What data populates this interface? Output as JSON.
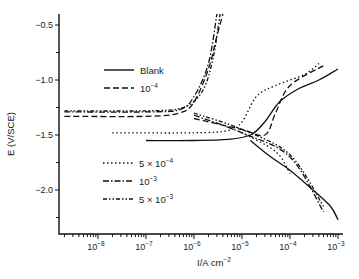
{
  "chart_data": {
    "type": "line",
    "title": "",
    "xlabel": "I/A cm⁻²",
    "ylabel": "E (V/SCE)",
    "xscale": "log",
    "xlim": [
      2e-09,
      0.0013
    ],
    "ylim": [
      -2.35,
      -0.4
    ],
    "grid": false,
    "legend_position": "inside-left",
    "x_ticks": [
      {
        "base": "10",
        "exp": "−8",
        "value": 1e-08
      },
      {
        "base": "10",
        "exp": "−7",
        "value": 1e-07
      },
      {
        "base": "10",
        "exp": "−6",
        "value": 1e-06
      },
      {
        "base": "10",
        "exp": "−5",
        "value": 1e-05
      },
      {
        "base": "10",
        "exp": "−4",
        "value": 0.0001
      },
      {
        "base": "10",
        "exp": "−3",
        "value": 0.001
      }
    ],
    "y_ticks": [
      {
        "label": "−0.5",
        "value": -0.5
      },
      {
        "label": "−1.0",
        "value": -1.0
      },
      {
        "label": "−1.5",
        "value": -1.5
      },
      {
        "label": "−2.0",
        "value": -2.0
      }
    ],
    "series": [
      {
        "name": "Blank",
        "legend_base": "Blank",
        "legend_exp": "",
        "legend_mult": "",
        "style": "solid",
        "corrosion_potential": -1.55,
        "corrosion_current": 1.5e-05,
        "anodic": [
          [
            1e-07,
            -1.55
          ],
          [
            1e-06,
            -1.55
          ],
          [
            5e-06,
            -1.54
          ],
          [
            1.5e-05,
            -1.5
          ],
          [
            3e-05,
            -1.38
          ],
          [
            6e-05,
            -1.2
          ],
          [
            0.00015,
            -1.08
          ],
          [
            0.0004,
            -1.0
          ],
          [
            0.001,
            -0.9
          ]
        ],
        "cathodic": [
          [
            1.5e-05,
            -1.55
          ],
          [
            4e-05,
            -1.7
          ],
          [
            0.0001,
            -1.82
          ],
          [
            0.0003,
            -2.0
          ],
          [
            0.0007,
            -2.15
          ],
          [
            0.001,
            -2.27
          ]
        ]
      },
      {
        "name": "10^-4",
        "legend_base": "10",
        "legend_exp": "−4",
        "legend_mult": "",
        "style": "dashed",
        "corrosion_potential": -1.33,
        "corrosion_current": 4e-07,
        "anodic": [
          [
            2e-09,
            -1.33
          ],
          [
            1e-07,
            -1.33
          ],
          [
            5e-07,
            -1.3
          ],
          [
            1e-06,
            -1.2
          ],
          [
            2e-06,
            -0.9
          ],
          [
            3e-06,
            -0.6
          ],
          [
            4e-06,
            -0.4
          ]
        ],
        "cathodic_far": [
          [
            1e-06,
            -1.35
          ],
          [
            1e-05,
            -1.45
          ],
          [
            3e-05,
            -1.5
          ],
          [
            5e-05,
            -1.3
          ],
          [
            0.0001,
            -1.05
          ],
          [
            0.0005,
            -0.87
          ]
        ]
      },
      {
        "name": "5 × 10^-4",
        "legend_base": "10",
        "legend_exp": "−4",
        "legend_mult": "5 × ",
        "style": "dotted",
        "corrosion_potential": -1.48,
        "corrosion_current": 1e-05,
        "anodic": [
          [
            2e-08,
            -1.48
          ],
          [
            1e-06,
            -1.48
          ],
          [
            5e-06,
            -1.46
          ],
          [
            1e-05,
            -1.38
          ],
          [
            2e-05,
            -1.15
          ],
          [
            5e-05,
            -1.05
          ],
          [
            0.0002,
            -0.95
          ],
          [
            0.0004,
            -0.85
          ]
        ],
        "cathodic": [
          [
            1e-05,
            -1.48
          ],
          [
            5e-05,
            -1.65
          ],
          [
            0.0001,
            -1.85
          ]
        ]
      },
      {
        "name": "10^-3",
        "legend_base": "10",
        "legend_exp": "−3",
        "legend_mult": "",
        "style": "dash-dot",
        "corrosion_potential": -1.29,
        "corrosion_current": 5e-07,
        "anodic": [
          [
            2e-09,
            -1.29
          ],
          [
            1e-07,
            -1.29
          ],
          [
            5e-07,
            -1.27
          ],
          [
            1e-06,
            -1.15
          ],
          [
            2e-06,
            -0.85
          ],
          [
            3e-06,
            -0.4
          ]
        ],
        "cathodic": [
          [
            1e-06,
            -1.32
          ],
          [
            1e-05,
            -1.48
          ],
          [
            0.0001,
            -1.7
          ],
          [
            0.0005,
            -2.2
          ]
        ]
      },
      {
        "name": "5 × 10^-3",
        "legend_base": "10",
        "legend_exp": "−3",
        "legend_mult": "5 × ",
        "style": "dash-dot-dot",
        "corrosion_potential": -1.28,
        "corrosion_current": 6e-07,
        "anodic": [
          [
            2e-09,
            -1.28
          ],
          [
            1e-07,
            -1.28
          ],
          [
            6e-07,
            -1.25
          ],
          [
            1.5e-06,
            -1.1
          ],
          [
            2.5e-06,
            -0.8
          ],
          [
            3.5e-06,
            -0.4
          ]
        ],
        "cathodic": [
          [
            1e-06,
            -1.3
          ],
          [
            1e-05,
            -1.45
          ],
          [
            0.0001,
            -1.68
          ],
          [
            0.0005,
            -2.15
          ]
        ]
      }
    ]
  }
}
